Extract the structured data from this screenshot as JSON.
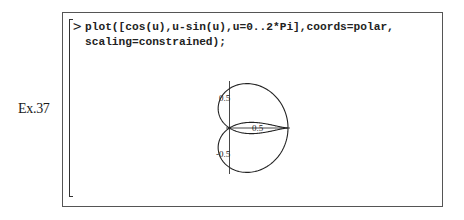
{
  "example_label": "Ex.37",
  "input": {
    "prompt": ">",
    "lines": [
      "plot([cos(u),u-sin(u),u=0..2*Pi],coords=polar,",
      "scaling=constrained);"
    ]
  },
  "chart_data": {
    "type": "line",
    "title": "",
    "coords": "polar",
    "parameter": {
      "name": "u",
      "range": [
        0,
        6.2832
      ]
    },
    "radius_expr": "cos(u)",
    "angle_expr": "u-sin(u)",
    "scaling": "constrained",
    "x_ticks": [
      {
        "value": 0.5,
        "label": "0.5"
      }
    ],
    "y_ticks": [
      {
        "value": 0.5,
        "label": "0.5"
      },
      {
        "value": -0.5,
        "label": "-0.5"
      }
    ],
    "xlim": [
      0,
      1
    ],
    "ylim": [
      -0.85,
      0.85
    ],
    "xlabel": "",
    "ylabel": "",
    "grid": false,
    "legend": false,
    "stroke_color": "#222222"
  }
}
